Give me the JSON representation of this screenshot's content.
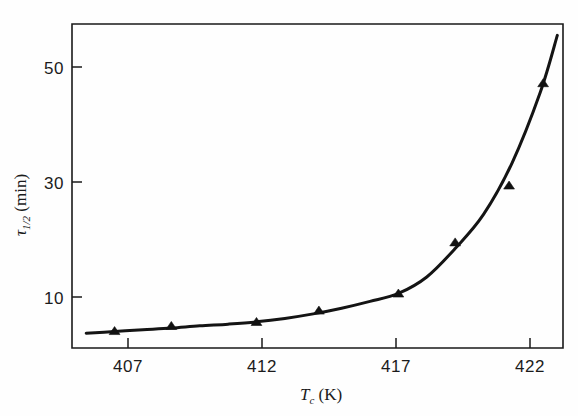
{
  "chart_data": {
    "type": "line",
    "title": "",
    "subtitle": "",
    "xlabel": "T_c (K)",
    "xlabel_parts": {
      "symbol": "T",
      "subscript": "c",
      "unit": "(K)"
    },
    "ylabel": "τ 1/2 (min)",
    "ylabel_parts": {
      "symbol": "τ",
      "subscript": "1/2",
      "unit": "(min)"
    },
    "xlim": [
      405.5,
      422.8
    ],
    "ylim": [
      1.0,
      58.0
    ],
    "xticks": [
      407,
      412,
      417,
      422
    ],
    "xticklabels": [
      "407",
      "412",
      "417",
      "422"
    ],
    "yticks": [
      10,
      30,
      50
    ],
    "yticklabels": [
      "10",
      "30",
      "50"
    ],
    "grid": false,
    "legend": false,
    "legend_position": "none",
    "frame": "box",
    "series": [
      {
        "name": "measured half-life",
        "marker": "triangle-up",
        "marker_color": "#111111",
        "line_color": "#141414",
        "x": [
          407.0,
          409.0,
          412.0,
          414.2,
          417.0,
          419.0,
          420.9,
          422.1
        ],
        "y": [
          3.9,
          4.8,
          5.5,
          7.5,
          10.5,
          19.5,
          29.5,
          47.5
        ]
      }
    ],
    "fit_curve": {
      "name": "fitted curve",
      "x": [
        406.0,
        407.0,
        408.0,
        409.0,
        410.0,
        411.0,
        412.0,
        413.0,
        414.0,
        415.0,
        416.0,
        417.0,
        418.0,
        419.0,
        420.0,
        421.0,
        422.0,
        422.6
      ],
      "y": [
        3.6,
        3.9,
        4.2,
        4.5,
        4.9,
        5.2,
        5.6,
        6.2,
        7.0,
        8.0,
        9.2,
        10.6,
        13.5,
        18.5,
        24.5,
        33.5,
        46.0,
        56.0
      ]
    }
  },
  "colors": {
    "background": "#ffffff",
    "axis": "#1a1a1a",
    "curve": "#141414",
    "marker": "#111111",
    "text": "#1b1b1b"
  }
}
